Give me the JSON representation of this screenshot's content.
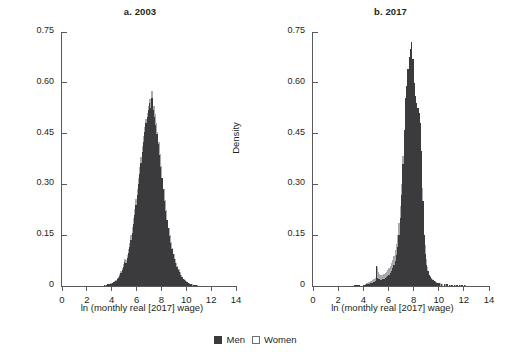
{
  "figure": {
    "legend": [
      {
        "key": "men",
        "label": "Men",
        "swatch": "filled-square",
        "color": "#3b3b3d"
      },
      {
        "key": "women",
        "label": "Women",
        "swatch": "open-square",
        "color": "#ffffff"
      }
    ]
  },
  "chart_data": [
    {
      "type": "bar",
      "panel": "a",
      "title": "a. 2003",
      "xlabel": "ln (monthly real [2017] wage)",
      "ylabel": "Density",
      "xlim": [
        0,
        14
      ],
      "ylim": [
        0,
        0.75
      ],
      "xticks": [
        0,
        2,
        4,
        6,
        8,
        10,
        12,
        14
      ],
      "xticklabels": [
        "0",
        "2",
        "4",
        "6",
        "8",
        "10",
        "12",
        "14"
      ],
      "yticks": [
        0,
        0.15,
        0.3,
        0.45,
        0.6,
        0.75
      ],
      "yticklabels": [
        "0",
        "0.15",
        "0.30",
        "0.45",
        "0.60",
        "0.75"
      ],
      "grid": false,
      "legend_position": "bottom-center",
      "bin_width": 0.1,
      "x": [
        3.4,
        3.5,
        3.6,
        3.7,
        3.8,
        3.9,
        4.0,
        4.1,
        4.2,
        4.3,
        4.4,
        4.5,
        4.6,
        4.7,
        4.8,
        4.9,
        5.0,
        5.1,
        5.2,
        5.3,
        5.4,
        5.5,
        5.6,
        5.7,
        5.8,
        5.9,
        6.0,
        6.1,
        6.2,
        6.3,
        6.4,
        6.5,
        6.6,
        6.7,
        6.8,
        6.9,
        7.0,
        7.1,
        7.2,
        7.3,
        7.4,
        7.5,
        7.6,
        7.7,
        7.8,
        7.9,
        8.0,
        8.1,
        8.2,
        8.3,
        8.4,
        8.5,
        8.6,
        8.7,
        8.8,
        8.9,
        9.0,
        9.1,
        9.2,
        9.3,
        9.4,
        9.5,
        9.6,
        9.7,
        9.8,
        9.9,
        10.0,
        10.1,
        10.2,
        10.3,
        10.4,
        10.5,
        10.6,
        10.7,
        10.8
      ],
      "series": [
        {
          "name": "Men",
          "values": [
            0.004,
            0.004,
            0.005,
            0.005,
            0.006,
            0.007,
            0.009,
            0.011,
            0.013,
            0.016,
            0.02,
            0.025,
            0.031,
            0.038,
            0.047,
            0.057,
            0.07,
            0.068,
            0.082,
            0.098,
            0.115,
            0.135,
            0.158,
            0.183,
            0.21,
            0.238,
            0.268,
            0.3,
            0.332,
            0.363,
            0.395,
            0.425,
            0.455,
            0.48,
            0.5,
            0.52,
            0.54,
            0.525,
            0.555,
            0.52,
            0.5,
            0.475,
            0.45,
            0.42,
            0.388,
            0.352,
            0.318,
            0.285,
            0.252,
            0.222,
            0.195,
            0.17,
            0.148,
            0.128,
            0.11,
            0.094,
            0.08,
            0.068,
            0.057,
            0.048,
            0.04,
            0.033,
            0.027,
            0.022,
            0.018,
            0.014,
            0.011,
            0.009,
            0.007,
            0.006,
            0.005,
            0.004,
            0.003,
            0.003,
            0.002
          ]
        },
        {
          "name": "Women",
          "values": [
            0.004,
            0.004,
            0.005,
            0.006,
            0.007,
            0.008,
            0.01,
            0.012,
            0.015,
            0.018,
            0.023,
            0.028,
            0.035,
            0.043,
            0.053,
            0.065,
            0.079,
            0.076,
            0.092,
            0.11,
            0.128,
            0.15,
            0.175,
            0.2,
            0.228,
            0.256,
            0.286,
            0.318,
            0.35,
            0.382,
            0.412,
            0.442,
            0.47,
            0.494,
            0.512,
            0.532,
            0.552,
            0.538,
            0.575,
            0.532,
            0.508,
            0.482,
            0.455,
            0.424,
            0.39,
            0.355,
            0.32,
            0.286,
            0.254,
            0.224,
            0.196,
            0.172,
            0.15,
            0.13,
            0.112,
            0.096,
            0.081,
            0.069,
            0.058,
            0.049,
            0.041,
            0.034,
            0.028,
            0.022,
            0.018,
            0.014,
            0.011,
            0.009,
            0.007,
            0.006,
            0.005,
            0.004,
            0.003,
            0.003,
            0.002
          ]
        }
      ]
    },
    {
      "type": "bar",
      "panel": "b",
      "title": "b. 2017",
      "xlabel": "ln (monthly real [2017] wage)",
      "ylabel": "Density",
      "xlim": [
        0,
        14
      ],
      "ylim": [
        0,
        0.75
      ],
      "xticks": [
        0,
        2,
        4,
        6,
        8,
        10,
        12,
        14
      ],
      "xticklabels": [
        "0",
        "2",
        "4",
        "6",
        "8",
        "10",
        "12",
        "14"
      ],
      "yticks": [
        0,
        0.15,
        0.3,
        0.45,
        0.6,
        0.75
      ],
      "yticklabels": [
        "0",
        "0.15",
        "0.30",
        "0.45",
        "0.60",
        "0.75"
      ],
      "grid": false,
      "legend_position": "bottom-center",
      "bin_width": 0.1,
      "annotations": [
        "spike near ln wage = 5 (minimum wage bunching)"
      ],
      "x": [
        3.3,
        3.4,
        3.5,
        3.6,
        3.7,
        3.8,
        3.9,
        4.0,
        4.1,
        4.2,
        4.3,
        4.4,
        4.5,
        4.6,
        4.7,
        4.8,
        4.9,
        5.0,
        5.1,
        5.2,
        5.3,
        5.4,
        5.5,
        5.6,
        5.7,
        5.8,
        5.9,
        6.0,
        6.1,
        6.2,
        6.3,
        6.4,
        6.5,
        6.6,
        6.7,
        6.8,
        6.9,
        7.0,
        7.1,
        7.2,
        7.3,
        7.4,
        7.5,
        7.6,
        7.7,
        7.8,
        7.9,
        8.0,
        8.1,
        8.2,
        8.3,
        8.4,
        8.5,
        8.6,
        8.7,
        8.8,
        8.9,
        9.0,
        9.1,
        9.2,
        9.3,
        9.4,
        9.5,
        9.6,
        9.7,
        9.8,
        9.9,
        10.0,
        10.2,
        10.4,
        10.6,
        10.8,
        11.0,
        11.2,
        11.4,
        11.6,
        11.8,
        12.0
      ],
      "series": [
        {
          "name": "Men",
          "values": [
            0.003,
            0.003,
            0.003,
            0.002,
            0.0,
            0.0,
            0.0,
            0.003,
            0.004,
            0.005,
            0.006,
            0.007,
            0.008,
            0.009,
            0.01,
            0.012,
            0.014,
            0.06,
            0.024,
            0.02,
            0.019,
            0.019,
            0.02,
            0.021,
            0.023,
            0.026,
            0.029,
            0.033,
            0.038,
            0.044,
            0.052,
            0.062,
            0.075,
            0.092,
            0.115,
            0.15,
            0.2,
            0.27,
            0.36,
            0.46,
            0.555,
            0.59,
            0.64,
            0.675,
            0.7,
            0.72,
            0.67,
            0.6,
            0.56,
            0.54,
            0.525,
            0.51,
            0.48,
            0.4,
            0.25,
            0.15,
            0.095,
            0.062,
            0.044,
            0.033,
            0.026,
            0.021,
            0.017,
            0.014,
            0.012,
            0.01,
            0.009,
            0.008,
            0.006,
            0.005,
            0.005,
            0.004,
            0.004,
            0.003,
            0.003,
            0.003,
            0.003,
            0.002
          ]
        },
        {
          "name": "Women",
          "values": [
            0.003,
            0.003,
            0.003,
            0.002,
            0.0,
            0.0,
            0.0,
            0.004,
            0.006,
            0.008,
            0.01,
            0.012,
            0.014,
            0.016,
            0.018,
            0.021,
            0.025,
            0.055,
            0.04,
            0.035,
            0.033,
            0.032,
            0.033,
            0.035,
            0.038,
            0.042,
            0.047,
            0.053,
            0.06,
            0.068,
            0.078,
            0.09,
            0.105,
            0.125,
            0.15,
            0.185,
            0.235,
            0.3,
            0.385,
            0.42,
            0.4,
            0.38,
            0.37,
            0.36,
            0.35,
            0.345,
            0.34,
            0.33,
            0.32,
            0.33,
            0.34,
            0.345,
            0.33,
            0.29,
            0.19,
            0.12,
            0.08,
            0.055,
            0.04,
            0.031,
            0.025,
            0.02,
            0.017,
            0.014,
            0.012,
            0.01,
            0.009,
            0.008,
            0.006,
            0.005,
            0.005,
            0.004,
            0.004,
            0.003,
            0.003,
            0.003,
            0.003,
            0.002
          ]
        }
      ]
    }
  ]
}
